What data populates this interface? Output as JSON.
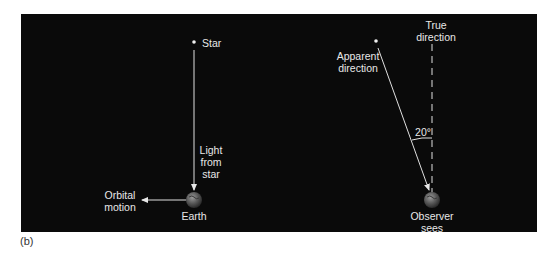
{
  "figure": {
    "panel_label": "(b)",
    "background_color": "#0a0a0a",
    "foreground_color": "#e8e8e8"
  },
  "left_diagram": {
    "star_label": "Star",
    "light_label_line1": "Light",
    "light_label_line2": "from",
    "light_label_line3": "star",
    "earth_label": "Earth",
    "orbital_label_line1": "Orbital",
    "orbital_label_line2": "motion"
  },
  "right_diagram": {
    "apparent_label_line1": "Apparent",
    "apparent_label_line2": "direction",
    "true_label_line1": "True",
    "true_label_line2": "direction",
    "angle_label": "20°",
    "observer_label_line1": "Observer",
    "observer_label_line2": "sees"
  }
}
